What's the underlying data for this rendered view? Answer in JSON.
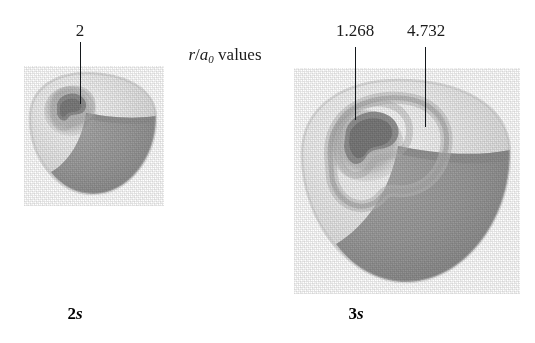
{
  "figure": {
    "title_note": {
      "prefix_italic_r": "r",
      "slash": "/",
      "italic_a": "a",
      "subscript": "0",
      "suffix": " values"
    },
    "background_color": "#ffffff",
    "ink_color": "#1c1c1c"
  },
  "colors": {
    "outer_surface": "#e3e3e3",
    "outer_surface_highlight": "#f4f4f4",
    "cut_surface": "#9b9b9b",
    "cut_surface_shadow": "#8c8c8c",
    "node_dark": "#8f8f8f",
    "node_core": "#7c7c7c",
    "leader_line": "#14181c",
    "label_text": "#1c1c1c",
    "caption_text": "#000000"
  },
  "orbitals": [
    {
      "id": "2s",
      "caption_number": "2",
      "caption_letter": "s",
      "caption_x": 75,
      "radial_node_count": 1,
      "node_labels": [
        {
          "text": "2",
          "label_x": 80,
          "label_y": 22,
          "leader_x": 80,
          "leader_top": 42,
          "leader_bottom": 104
        }
      ]
    },
    {
      "id": "3s",
      "caption_number": "3",
      "caption_letter": "s",
      "caption_x": 356,
      "radial_node_count": 2,
      "node_labels": [
        {
          "text": "1.268",
          "label_x": 355,
          "label_y": 22,
          "leader_x": 355,
          "leader_top": 47,
          "leader_bottom": 120
        },
        {
          "text": "4.732",
          "label_x": 426,
          "label_y": 22,
          "leader_x": 425,
          "leader_top": 47,
          "leader_bottom": 127
        }
      ]
    }
  ]
}
